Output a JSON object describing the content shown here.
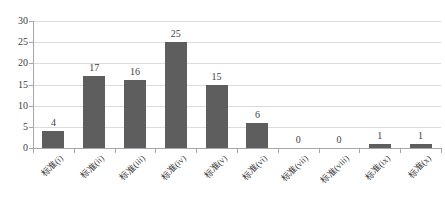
{
  "chart_data": {
    "type": "bar",
    "title": "",
    "xlabel": "",
    "ylabel": "",
    "categories": [
      "标准(i)",
      "标准(ii)",
      "标准(iii)",
      "标准(iv)",
      "标准(v)",
      "标准(vi)",
      "标准(vii)",
      "标准(viii)",
      "标准(ix)",
      "标准(x)"
    ],
    "values": [
      4,
      17,
      16,
      25,
      15,
      6,
      0,
      0,
      1,
      1
    ],
    "yticks": [
      0,
      5,
      10,
      15,
      20,
      25,
      30
    ],
    "ylim": [
      0,
      30
    ],
    "grid": true,
    "legend": "none",
    "data_labels": true,
    "colors": {
      "bar": "#5e5e5e",
      "gridline": "#dcdcdc",
      "axis": "#a6a6a6",
      "text": "#404040",
      "background": "#ffffff"
    }
  }
}
